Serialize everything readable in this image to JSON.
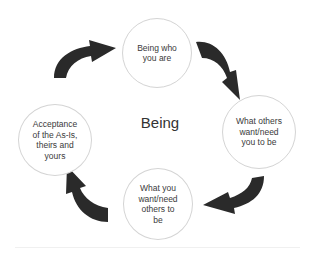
{
  "diagram": {
    "title": "Being",
    "nodes": [
      {
        "id": "top",
        "label": "Being who\nyou are"
      },
      {
        "id": "right",
        "label": "What others\nwant/need\nyou to be"
      },
      {
        "id": "bottom",
        "label": "What you\nwant/need\nothers to\nbe"
      },
      {
        "id": "left",
        "label": "Acceptance\nof the As-Is,\ntheirs and\nyours"
      }
    ],
    "edges": [
      {
        "from": "top",
        "to": "right"
      },
      {
        "from": "right",
        "to": "bottom"
      },
      {
        "from": "bottom",
        "to": "left"
      },
      {
        "from": "left",
        "to": "top"
      }
    ],
    "colors": {
      "arrow": "#2a2a2a",
      "circle_border": "#d4d4d4",
      "text": "#3a3a3a"
    }
  }
}
